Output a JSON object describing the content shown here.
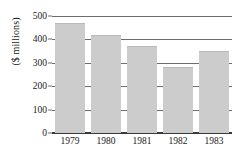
{
  "chart_data": {
    "type": "bar",
    "title": "",
    "subtitle": "",
    "xlabel": "",
    "ylabel": "($ millions)",
    "categories": [
      "1979",
      "1980",
      "1981",
      "1982",
      "1983"
    ],
    "values": [
      470,
      420,
      370,
      282,
      350
    ],
    "series": [
      {
        "name": "",
        "values": [
          470,
          420,
          370,
          282,
          350
        ]
      }
    ],
    "ylim": [
      0,
      500
    ],
    "yticks": [
      0,
      100,
      200,
      300,
      400,
      500
    ],
    "ytick_labels": [
      "0",
      "100",
      "200",
      "300",
      "400",
      "500"
    ],
    "grid": true,
    "legend": false,
    "legend_position": "none",
    "bar_color": "#cccccc",
    "gridline_color": "#6e6e6e",
    "axis_color": "#3a3a3a",
    "text_color": "#1a1a1a"
  }
}
